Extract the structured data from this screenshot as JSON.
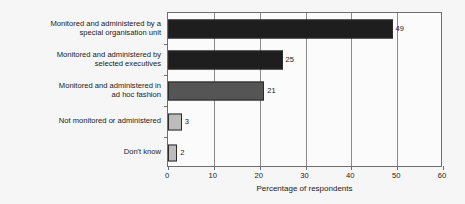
{
  "chart_data": {
    "type": "bar",
    "orientation": "horizontal",
    "title": "",
    "xlabel": "Percentage of respondents",
    "ylabel": "",
    "xlim": [
      0,
      60
    ],
    "xticks": [
      0,
      10,
      20,
      30,
      40,
      50,
      60
    ],
    "grid": "vertical",
    "legend": "none",
    "categories": [
      "Monitored and administered by a special organisation unit",
      "Monitored and administered by selected executives",
      "Monitored and administered in ad hoc fashion",
      "Not monitored or administered",
      "Don't know"
    ],
    "category_lines": [
      [
        "Monitored and administered by a",
        "special organisation unit"
      ],
      [
        "Monitored and administered by",
        "selected executives"
      ],
      [
        "Monitored and administered in",
        "ad hoc fashion"
      ],
      [
        "Not monitored or administered"
      ],
      [
        "Don't know"
      ]
    ],
    "values": [
      49,
      25,
      21,
      3,
      2
    ],
    "value_labels": [
      "49",
      "25",
      "21",
      "3",
      "2"
    ],
    "bar_colors": [
      "#1e1e1e",
      "#1e1e1e",
      "#555555",
      "#bcbcbc",
      "#bcbcbc"
    ]
  }
}
